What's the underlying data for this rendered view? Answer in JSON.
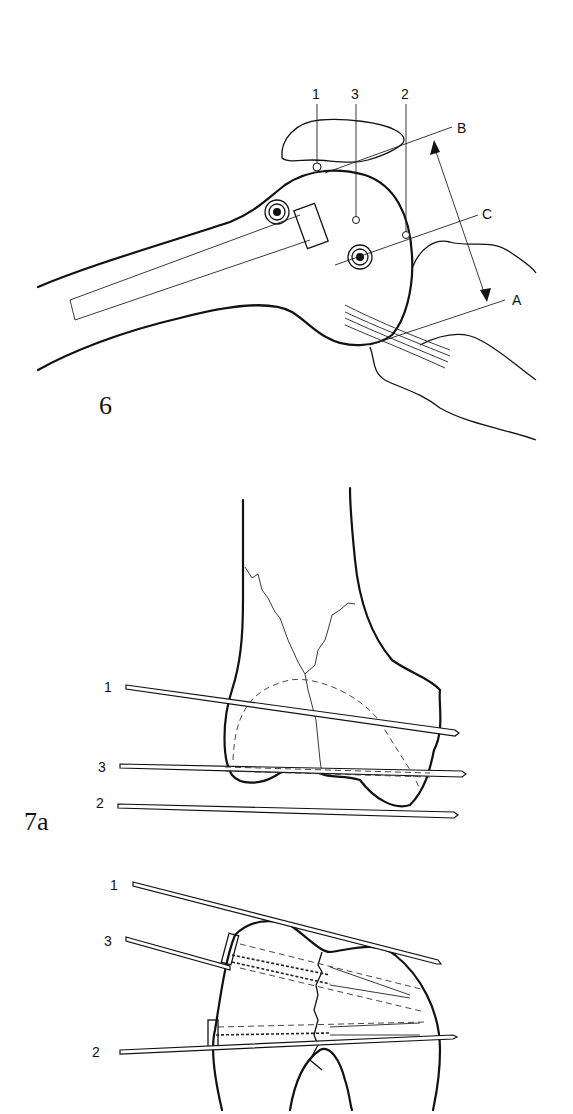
{
  "figure6": {
    "label": "6",
    "pin_labels": [
      "1",
      "3",
      "2"
    ],
    "plane_labels": {
      "b": "B",
      "c": "C",
      "a": "A"
    }
  },
  "figure7a": {
    "label": "7a",
    "upper_wire_labels": [
      "1",
      "3",
      "2"
    ],
    "lower_wire_labels": [
      "1",
      "3",
      "2"
    ]
  },
  "colors": {
    "ink": "#111111",
    "background": "#ffffff"
  }
}
